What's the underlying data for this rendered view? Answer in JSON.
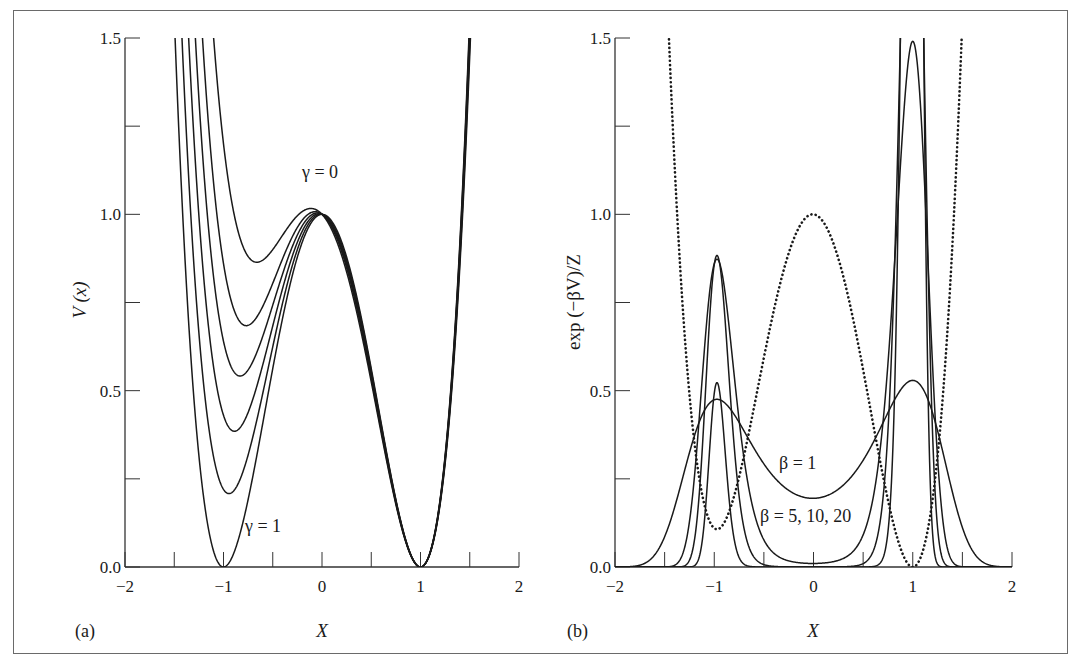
{
  "figure": {
    "panels": [
      {
        "id": "a",
        "panel_label": "(a)",
        "xlabel": "X",
        "ylabel": "V (x)",
        "annotations": [
          {
            "text": "γ = 0",
            "x": -0.2,
            "y": 1.18
          },
          {
            "text": "γ = 1",
            "x": -0.84,
            "y": 0.11
          }
        ]
      },
      {
        "id": "b",
        "panel_label": "(b)",
        "xlabel": "X",
        "ylabel": "exp (−βV)/Z",
        "annotations": [
          {
            "text": "β = 1",
            "x": -0.25,
            "y": 0.3
          },
          {
            "text": "β = 5, 10, 20",
            "x": -0.45,
            "y": 0.11
          }
        ]
      }
    ]
  },
  "chart_data": [
    {
      "type": "line",
      "title": "",
      "panel": "(a)",
      "xlabel": "X",
      "ylabel": "V (x)",
      "xlim": [
        -2,
        2
      ],
      "ylim": [
        0,
        1.5
      ],
      "xticks": [
        -2,
        -1.5,
        -1,
        -0.5,
        0,
        0.5,
        1,
        1.5,
        2
      ],
      "xtick_labels": [
        "−2",
        "",
        "−1",
        "",
        "0",
        "",
        "1",
        "",
        "2"
      ],
      "yticks": [
        0,
        0.25,
        0.5,
        0.75,
        1.0,
        1.25,
        1.5
      ],
      "ytick_labels": [
        "0.0",
        "",
        "0.5",
        "",
        "1.0",
        "",
        "1.5"
      ],
      "grid": false,
      "legend": "none (inline annotations)",
      "model": "V(x) = (x^2-1)^2 + a * (-x (x-1)^2 / 4)",
      "series": [
        {
          "name": "γ = 0",
          "a": 1.2,
          "left_min": null,
          "style": "solid"
        },
        {
          "name": "γ = 0.2",
          "a": 0.86,
          "left_min": [
            -0.53,
            0.8
          ],
          "style": "solid"
        },
        {
          "name": "γ = 0.4",
          "a": 0.64,
          "left_min": [
            -0.7,
            0.6
          ],
          "style": "solid"
        },
        {
          "name": "γ = 0.6",
          "a": 0.43,
          "left_min": [
            -0.8,
            0.4
          ],
          "style": "solid"
        },
        {
          "name": "γ = 0.8",
          "a": 0.22,
          "left_min": [
            -0.92,
            0.21
          ],
          "style": "solid"
        },
        {
          "name": "γ = 1",
          "a": 0.0,
          "left_min": [
            -1.0,
            0.0
          ],
          "style": "solid"
        }
      ],
      "key_points": {
        "barrier_top": [
          0,
          1.0
        ],
        "right_min": [
          1,
          0.0
        ]
      }
    },
    {
      "type": "line",
      "title": "",
      "panel": "(b)",
      "xlabel": "X",
      "ylabel": "exp (−βV)/Z",
      "xlim": [
        -2,
        2
      ],
      "ylim": [
        0,
        1.5
      ],
      "xticks": [
        -2,
        -1.5,
        -1,
        -0.5,
        0,
        0.5,
        1,
        1.5,
        2
      ],
      "xtick_labels": [
        "−2",
        "",
        "−1",
        "",
        "0",
        "",
        "1",
        "",
        "2"
      ],
      "yticks": [
        0,
        0.25,
        0.5,
        0.75,
        1.0,
        1.25,
        1.5
      ],
      "ytick_labels": [
        "0.0",
        "",
        "0.5",
        "",
        "1.0",
        "",
        "1.5"
      ],
      "grid": false,
      "legend": "none (inline annotations)",
      "potential": {
        "model": "V(x) = (x^2-1)^2 + a * (-x (x-1)^2 / 4)",
        "a": 0.11
      },
      "series": [
        {
          "name": "V(x) (dotted)",
          "kind": "potential",
          "style": "dotted",
          "left_min": [
            -0.97,
            0.11
          ],
          "center": [
            0,
            1.0
          ],
          "right_min": [
            1,
            0.0
          ]
        },
        {
          "name": "β = 1",
          "kind": "boltzmann",
          "beta": 1,
          "style": "solid",
          "peaks": [
            [
              -0.95,
              0.47
            ],
            [
              1.03,
              0.53
            ]
          ],
          "center": [
            0,
            0.196
          ]
        },
        {
          "name": "β = 5",
          "kind": "boltzmann",
          "beta": 5,
          "style": "solid",
          "peaks": [
            [
              -0.95,
              0.59
            ],
            [
              1.02,
              0.93
            ]
          ]
        },
        {
          "name": "β = 10",
          "kind": "boltzmann",
          "beta": 10,
          "style": "solid",
          "peaks": [
            [
              -0.93,
              0.89
            ],
            [
              1.06,
              1.48
            ]
          ]
        },
        {
          "name": "β = 20",
          "kind": "boltzmann",
          "beta": 20,
          "style": "solid",
          "peaks": [
            [
              -0.93,
              0.925
            ],
            [
              1.04,
              1.9
            ]
          ]
        }
      ]
    }
  ],
  "layout": {
    "panels_px": [
      {
        "x0": 125,
        "x1": 519,
        "y0": 567,
        "y1": 38
      },
      {
        "x0": 615,
        "x1": 1012,
        "y0": 567,
        "y1": 38
      }
    ]
  }
}
